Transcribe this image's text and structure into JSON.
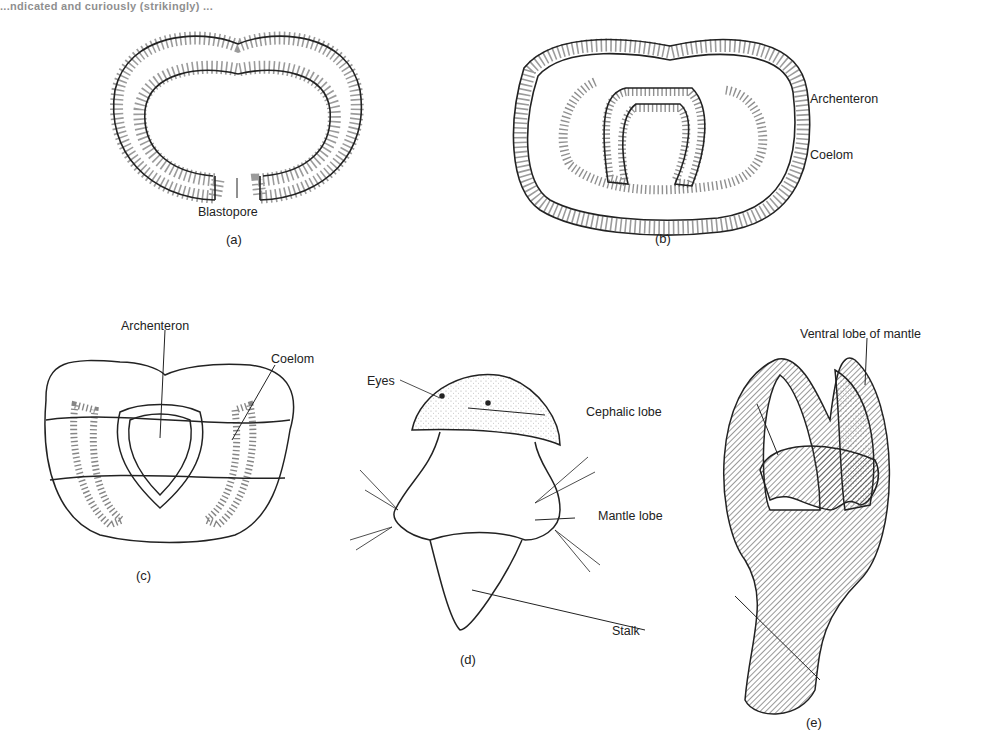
{
  "header_fragment": "...ndicated and curiously (strikingly) ...",
  "panels": {
    "a": {
      "caption": "(a)",
      "labels": {
        "blastopore": "Blastopore"
      }
    },
    "b": {
      "caption": "(b)",
      "labels": {
        "archenteron": "Archenteron",
        "coelom": "Coelom"
      }
    },
    "c": {
      "caption": "(c)",
      "labels": {
        "archenteron": "Archenteron",
        "coelom": "Coelom"
      }
    },
    "d": {
      "caption": "(d)",
      "labels": {
        "eyes": "Eyes",
        "cephalic_lobe": "Cephalic lobe",
        "mantle_lobe": "Mantle lobe",
        "stalk": "Stalk"
      }
    },
    "e": {
      "caption": "(e)",
      "labels": {
        "ventral_lobe": "Ventral lobe of mantle"
      }
    }
  },
  "colors": {
    "ink": "#222222",
    "background": "#ffffff"
  }
}
